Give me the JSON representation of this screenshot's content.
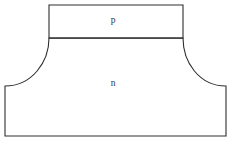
{
  "figure": {
    "background_color": "#ffffff",
    "line_color": "#2e2e2e",
    "label_color": "#333333",
    "width": 234,
    "height": 148
  },
  "regions": [
    {
      "id": "p-region",
      "label": "p",
      "shape": "rectangle",
      "label_x": 113,
      "label_y": 21,
      "bounds": {
        "left": 49,
        "top": 5,
        "right": 183,
        "bottom": 38
      }
    },
    {
      "id": "n-region",
      "label": "n",
      "shape": "filleted-base",
      "label_x": 113,
      "label_y": 84,
      "bounds": {
        "left": 5,
        "top": 38,
        "right": 226,
        "bottom": 136
      }
    }
  ],
  "geometry": {
    "p_rect_path": "M 49 5 L 183 5 L 183 38 L 49 38 Z",
    "n_body_path": "M 49 38 C 49 62, 32 86, 5 86 L 5 136 L 226 136 L 226 86 C 199 86, 183 62, 183 38 Z",
    "junction_path": "M 49 38 L 183 38",
    "fillet_left": {
      "start_x": 49,
      "start_y": 38,
      "end_x": 5,
      "end_y": 86
    },
    "fillet_right": {
      "start_x": 183,
      "start_y": 38,
      "end_x": 226,
      "end_y": 86
    }
  }
}
